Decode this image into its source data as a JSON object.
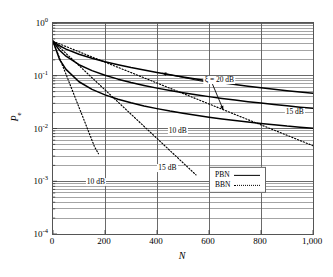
{
  "chart_data": {
    "type": "line",
    "title": "",
    "xlabel": "N",
    "ylabel": "P_e",
    "xlim": [
      0,
      1000
    ],
    "ylim": [
      0.0001,
      1
    ],
    "yscale": "log",
    "xscale": "linear",
    "grid": "major vertical at 200 intervals, minor+major horizontal log gridlines",
    "legend_position": "lower right inside axes",
    "xticks": [
      "0",
      "200",
      "400",
      "600",
      "800",
      "1,000"
    ],
    "xtick_values": [
      0,
      200,
      400,
      600,
      800,
      1000
    ],
    "yticks": [
      "10",
      "10",
      "10",
      "10",
      "10"
    ],
    "ytick_exponents": [
      "0",
      "-1",
      "-2",
      "-3",
      "-4"
    ],
    "ytick_values": [
      1,
      0.1,
      0.01,
      0.001,
      0.0001
    ],
    "legend": [
      {
        "name": "PBN",
        "style": "solid"
      },
      {
        "name": "BBN",
        "style": "dotted"
      }
    ],
    "annotations": [
      {
        "text": "ξ = 20 dB",
        "x": 640,
        "y": 0.082,
        "note": "double-headed arrow to PBN 20 dB and BBN 20 dB curves"
      },
      {
        "text": "15 dB",
        "x": 930,
        "y": 0.0205,
        "note": "PBN 15 dB curve label"
      },
      {
        "text": "10 dB",
        "x": 480,
        "y": 0.0088,
        "note": "PBN 10 dB curve label"
      },
      {
        "text": "15 dB",
        "x": 440,
        "y": 0.00175,
        "note": "BBN 15 dB curve label"
      },
      {
        "text": "10 dB",
        "x": 165,
        "y": 0.00096,
        "note": "BBN 10 dB curve label"
      }
    ],
    "series": [
      {
        "name": "PBN 20 dB",
        "style": "solid",
        "x": [
          0,
          25,
          50,
          100,
          150,
          200,
          250,
          300,
          350,
          400,
          450,
          500,
          550,
          600,
          650,
          700,
          750,
          800,
          850,
          900,
          950,
          1000
        ],
        "y": [
          0.45,
          0.37,
          0.32,
          0.255,
          0.215,
          0.185,
          0.162,
          0.143,
          0.128,
          0.115,
          0.104,
          0.0945,
          0.0865,
          0.0795,
          0.0735,
          0.068,
          0.0635,
          0.0592,
          0.0555,
          0.0522,
          0.0492,
          0.0465
        ]
      },
      {
        "name": "PBN 15 dB",
        "style": "solid",
        "x": [
          0,
          25,
          50,
          100,
          150,
          200,
          250,
          300,
          350,
          400,
          450,
          500,
          550,
          600,
          650,
          700,
          750,
          800,
          850,
          900,
          950,
          1000
        ],
        "y": [
          0.45,
          0.305,
          0.235,
          0.162,
          0.125,
          0.102,
          0.0862,
          0.0745,
          0.0655,
          0.0583,
          0.0525,
          0.0477,
          0.0437,
          0.0402,
          0.0372,
          0.0346,
          0.0323,
          0.0303,
          0.0285,
          0.0269,
          0.0254,
          0.0241
        ]
      },
      {
        "name": "PBN 10 dB",
        "style": "solid",
        "x": [
          0,
          25,
          50,
          100,
          150,
          200,
          250,
          300,
          350,
          400,
          450,
          500,
          550,
          600,
          650,
          700,
          750,
          800,
          850,
          900,
          950,
          1000
        ],
        "y": [
          0.45,
          0.205,
          0.132,
          0.077,
          0.0552,
          0.0434,
          0.0359,
          0.0307,
          0.0268,
          0.0238,
          0.0214,
          0.0195,
          0.0178,
          0.0164,
          0.0152,
          0.0142,
          0.0133,
          0.0125,
          0.0118,
          0.0111,
          0.0106,
          0.0101
        ]
      },
      {
        "name": "BBN 20 dB",
        "style": "dotted",
        "x": [
          0,
          100,
          200,
          300,
          400,
          500,
          600,
          700,
          800,
          900,
          1000
        ],
        "y": [
          0.45,
          0.285,
          0.181,
          0.115,
          0.0727,
          0.0461,
          0.0292,
          0.0185,
          0.0117,
          0.00744,
          0.00471
        ]
      },
      {
        "name": "BBN 15 dB",
        "style": "dotted",
        "x": [
          0,
          50,
          100,
          150,
          200,
          250,
          300,
          350,
          400,
          450,
          500,
          550
        ],
        "y": [
          0.45,
          0.265,
          0.156,
          0.0918,
          0.054,
          0.0318,
          0.0187,
          0.011,
          0.00648,
          0.00381,
          0.00224,
          0.00132
        ]
      },
      {
        "name": "BBN 10 dB",
        "style": "dotted",
        "x": [
          0,
          20,
          40,
          60,
          80,
          100,
          120,
          140,
          160,
          175
        ],
        "y": [
          0.45,
          0.253,
          0.142,
          0.0799,
          0.0449,
          0.0252,
          0.0142,
          0.00796,
          0.00447,
          0.00333
        ]
      }
    ]
  },
  "axis": {
    "x_title": "N",
    "y_title_base": "P",
    "y_title_sub": "e"
  }
}
